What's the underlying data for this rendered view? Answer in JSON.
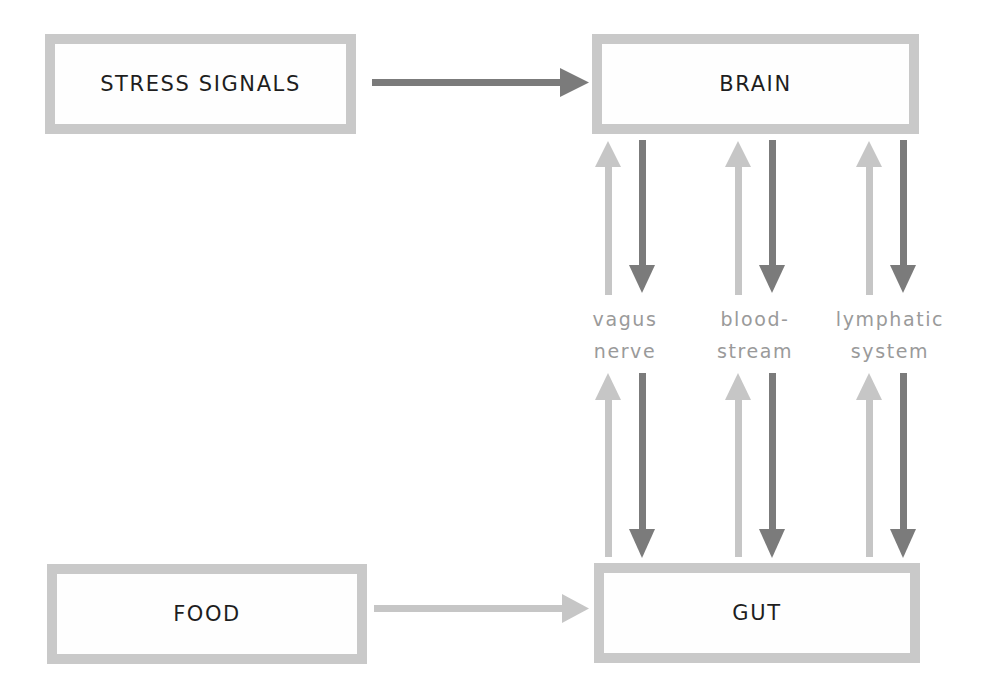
{
  "diagram": {
    "nodes": {
      "stress": {
        "label": "STRESS SIGNALS"
      },
      "brain": {
        "label": "BRAIN"
      },
      "food": {
        "label": "FOOD"
      },
      "gut": {
        "label": "GUT"
      }
    },
    "channels": [
      {
        "line1": "vagus",
        "line2": "nerve"
      },
      {
        "line1": "blood-",
        "line2": "stream"
      },
      {
        "line1": "lymphatic",
        "line2": "system"
      }
    ],
    "edges": [
      {
        "from": "STRESS SIGNALS",
        "to": "BRAIN",
        "shade": "dark"
      },
      {
        "from": "FOOD",
        "to": "GUT",
        "shade": "light"
      },
      {
        "from": "GUT",
        "to": "BRAIN",
        "via": "vagus nerve",
        "shade": "light"
      },
      {
        "from": "BRAIN",
        "to": "GUT",
        "via": "vagus nerve",
        "shade": "dark"
      },
      {
        "from": "GUT",
        "to": "BRAIN",
        "via": "bloodstream",
        "shade": "light"
      },
      {
        "from": "BRAIN",
        "to": "GUT",
        "via": "bloodstream",
        "shade": "dark"
      },
      {
        "from": "GUT",
        "to": "BRAIN",
        "via": "lymphatic system",
        "shade": "light"
      },
      {
        "from": "BRAIN",
        "to": "GUT",
        "via": "lymphatic system",
        "shade": "dark"
      }
    ],
    "colors": {
      "box_border": "#c9c9c9",
      "arrow_dark": "#7b7b7b",
      "arrow_light": "#c6c6c6",
      "label_text": "#9a9a9a",
      "node_text": "#1e1e1e"
    }
  }
}
